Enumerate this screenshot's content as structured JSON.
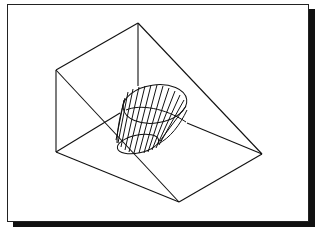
{
  "figure": {
    "stroke_color": "#111111",
    "frame_color": "#222222",
    "shadow_color": "#111111",
    "background_color": "#ffffff"
  }
}
